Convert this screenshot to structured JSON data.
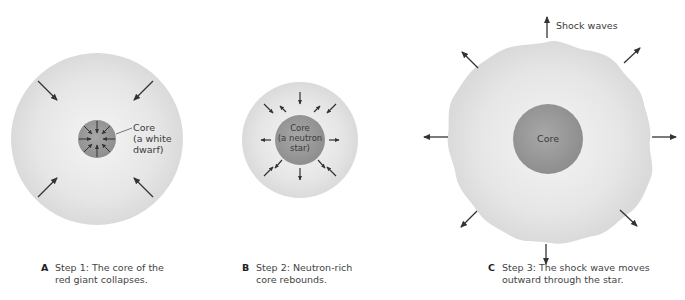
{
  "panels": [
    {
      "id": "A",
      "letter": "A",
      "caption_line1": "Step 1: The core of the",
      "caption_line2": "red giant collapses.",
      "core_label": [
        "Core",
        "(a white",
        "dwarf)"
      ],
      "arrow_direction": "inward"
    },
    {
      "id": "B",
      "letter": "B",
      "caption_line1": "Step 2: Neutron-rich",
      "caption_line2": "core rebounds.",
      "core_label": [
        "Core",
        "(a neutron",
        "star)"
      ],
      "arrow_direction": "outward-from-core"
    },
    {
      "id": "C",
      "letter": "C",
      "caption_line1": "Step 3: The shock wave moves",
      "caption_line2": "outward through the star.",
      "core_label": [
        "Core"
      ],
      "shock_label": "Shock waves",
      "arrow_direction": "outward"
    }
  ],
  "colors": {
    "envelope": "#e2e2e2",
    "envelope_center": "#f1f1f1",
    "core": "#9a9a9a",
    "arrow": "#333333"
  }
}
